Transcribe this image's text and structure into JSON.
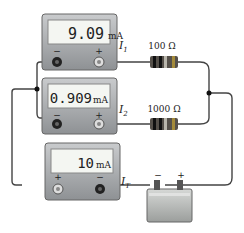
{
  "meters": [
    {
      "reading": "9.09",
      "unit": "mA",
      "label": "I",
      "sub": "1",
      "left_terminal": "−",
      "right_terminal": "+"
    },
    {
      "reading": "0.909",
      "unit": "mA",
      "label": "I",
      "sub": "2",
      "left_terminal": "−",
      "right_terminal": "+"
    },
    {
      "reading": "10",
      "unit": "mA",
      "label": "I",
      "sub": "T",
      "left_terminal": "+",
      "right_terminal": "−"
    }
  ],
  "resistors": [
    {
      "label": "100 Ω"
    },
    {
      "label": "1000 Ω"
    }
  ],
  "battery": {
    "neg": "−",
    "pos": "+"
  }
}
